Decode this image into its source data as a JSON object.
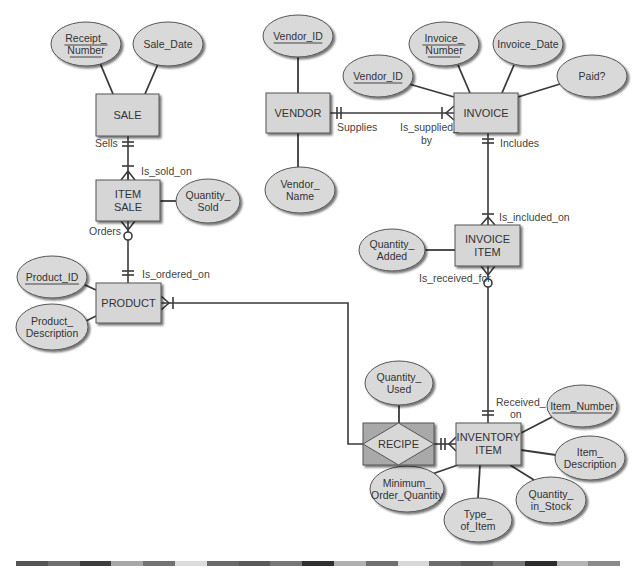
{
  "diagram": {
    "type": "entity-relationship",
    "colors": {
      "entity_fill": "#d6d6d6",
      "associative_fill": "#a9a9a9",
      "diamond_fill": "#d8d8d8",
      "attribute_fill": "#d9d9d9",
      "line": "#3a3a3a",
      "text": "#333333"
    },
    "entities": [
      {
        "id": "sale",
        "label": "SALE",
        "x": 96,
        "y": 94,
        "w": 63,
        "h": 42
      },
      {
        "id": "item_sale",
        "label_lines": [
          "ITEM",
          "SALE"
        ],
        "x": 96,
        "y": 180,
        "w": 64,
        "h": 41
      },
      {
        "id": "product",
        "label": "PRODUCT",
        "x": 96,
        "y": 283,
        "w": 65,
        "h": 40
      },
      {
        "id": "vendor",
        "label": "VENDOR",
        "x": 266,
        "y": 93,
        "w": 64,
        "h": 40
      },
      {
        "id": "invoice",
        "label": "INVOICE",
        "x": 454,
        "y": 93,
        "w": 64,
        "h": 40
      },
      {
        "id": "invoice_item",
        "label_lines": [
          "INVOICE",
          "ITEM"
        ],
        "x": 455,
        "y": 225,
        "w": 65,
        "h": 41
      },
      {
        "id": "inventory_item",
        "label_lines": [
          "INVENTORY",
          "ITEM"
        ],
        "x": 456,
        "y": 423,
        "w": 65,
        "h": 42
      }
    ],
    "associative_entity": {
      "id": "recipe",
      "label": "RECIPE",
      "x": 363,
      "y": 423,
      "w": 71,
      "h": 42
    },
    "attributes": [
      {
        "id": "receipt_number",
        "lines": [
          "Receipt_",
          "Number"
        ],
        "key": true,
        "cx": 86,
        "cy": 44,
        "rx": 35,
        "ry": 22
      },
      {
        "id": "sale_date",
        "lines": [
          "Sale_Date"
        ],
        "key": false,
        "cx": 168,
        "cy": 44,
        "rx": 35,
        "ry": 22
      },
      {
        "id": "quantity_sold",
        "lines": [
          "Quantity_",
          "Sold"
        ],
        "key": false,
        "cx": 208,
        "cy": 201,
        "rx": 32,
        "ry": 22
      },
      {
        "id": "product_id",
        "lines": [
          "Product_ID"
        ],
        "key": true,
        "cx": 52,
        "cy": 277,
        "rx": 35,
        "ry": 21
      },
      {
        "id": "product_description",
        "lines": [
          "Product_",
          "Description"
        ],
        "key": false,
        "cx": 52,
        "cy": 327,
        "rx": 36,
        "ry": 23
      },
      {
        "id": "vendor_id_v",
        "lines": [
          "Vendor_ID"
        ],
        "key": true,
        "cx": 298,
        "cy": 36,
        "rx": 35,
        "ry": 21
      },
      {
        "id": "vendor_name",
        "lines": [
          "Vendor_",
          "Name"
        ],
        "key": false,
        "cx": 300,
        "cy": 190,
        "rx": 35,
        "ry": 23
      },
      {
        "id": "vendor_id_i",
        "lines": [
          "Vendor_ID"
        ],
        "key": true,
        "cx": 378,
        "cy": 76,
        "rx": 35,
        "ry": 21
      },
      {
        "id": "invoice_number",
        "lines": [
          "Invoice_",
          "Number"
        ],
        "key": true,
        "cx": 444,
        "cy": 44,
        "rx": 35,
        "ry": 22
      },
      {
        "id": "invoice_date",
        "lines": [
          "Invoice_Date"
        ],
        "key": false,
        "cx": 528,
        "cy": 44,
        "rx": 35,
        "ry": 22
      },
      {
        "id": "paid",
        "lines": [
          "Paid?"
        ],
        "key": false,
        "cx": 592,
        "cy": 76,
        "rx": 35,
        "ry": 21
      },
      {
        "id": "quantity_added",
        "lines": [
          "Quantity_",
          "Added"
        ],
        "key": false,
        "cx": 392,
        "cy": 250,
        "rx": 33,
        "ry": 21
      },
      {
        "id": "quantity_used",
        "lines": [
          "Quantity_",
          "Used"
        ],
        "key": false,
        "cx": 399,
        "cy": 383,
        "rx": 34,
        "ry": 22
      },
      {
        "id": "item_number",
        "lines": [
          "Item_Number"
        ],
        "key": true,
        "cx": 582,
        "cy": 406,
        "rx": 35,
        "ry": 21
      },
      {
        "id": "item_description",
        "lines": [
          "Item_",
          "Description"
        ],
        "key": false,
        "cx": 590,
        "cy": 458,
        "rx": 35,
        "ry": 22
      },
      {
        "id": "minimum_order_quantity",
        "lines": [
          "Minimum_",
          "Order_Quantity"
        ],
        "key": false,
        "cx": 407,
        "cy": 489,
        "rx": 37,
        "ry": 23
      },
      {
        "id": "quantity_in_stock",
        "lines": [
          "Quantity_",
          "in_Stock"
        ],
        "key": false,
        "cx": 551,
        "cy": 500,
        "rx": 35,
        "ry": 23
      },
      {
        "id": "type_of_item",
        "lines": [
          "Type_",
          "of_Item"
        ],
        "key": false,
        "cx": 478,
        "cy": 520,
        "rx": 34,
        "ry": 22
      }
    ],
    "attribute_links": [
      [
        "receipt_number",
        113,
        94,
        100,
        63
      ],
      [
        "sale_date",
        145,
        94,
        158,
        64
      ],
      [
        "quantity_sold",
        160,
        201,
        176,
        201
      ],
      [
        "product_id",
        96,
        290,
        83,
        284
      ],
      [
        "product_description",
        96,
        316,
        80,
        324
      ],
      [
        "vendor_id_v",
        298,
        93,
        298,
        57
      ],
      [
        "vendor_name",
        298,
        133,
        298,
        167
      ],
      [
        "vendor_id_i",
        454,
        97,
        409,
        84
      ],
      [
        "invoice_number",
        470,
        93,
        458,
        65
      ],
      [
        "invoice_date",
        502,
        93,
        514,
        65
      ],
      [
        "paid",
        518,
        97,
        560,
        84
      ],
      [
        "quantity_added",
        455,
        250,
        425,
        250
      ],
      [
        "quantity_used",
        399,
        423,
        399,
        405
      ],
      [
        "item_number",
        521,
        433,
        552,
        417
      ],
      [
        "item_description",
        521,
        450,
        556,
        455
      ],
      [
        "minimum_order_quantity",
        458,
        465,
        432,
        474
      ],
      [
        "type_of_item",
        480,
        465,
        478,
        498
      ],
      [
        "quantity_in_stock",
        510,
        465,
        534,
        480
      ]
    ],
    "relationships": [
      {
        "from": "sale",
        "to": "item_sale",
        "label_from": "Sells",
        "label_to": "Is_sold_on",
        "from_card": "one-mandatory",
        "to_card": "many-mandatory"
      },
      {
        "from": "product",
        "to": "item_sale",
        "label_from": "Is_ordered_on",
        "label_to": "Orders",
        "from_card": "one-mandatory",
        "to_card": "many-optional"
      },
      {
        "from": "vendor",
        "to": "invoice",
        "label_from": "Supplies",
        "label_to": "Is_supplied_by",
        "from_card": "one-mandatory",
        "to_card": "many-mandatory"
      },
      {
        "from": "invoice",
        "to": "invoice_item",
        "label_from": "Includes",
        "label_to": "Is_included_on",
        "from_card": "one-mandatory",
        "to_card": "many-mandatory"
      },
      {
        "from": "inventory_item",
        "to": "invoice_item",
        "label_from": "Received_on",
        "label_to": "Is_received_for",
        "from_card": "one-mandatory",
        "to_card": "many-optional"
      },
      {
        "from": "product",
        "to": "recipe",
        "label_from": "",
        "label_to": "",
        "from_card": "many-mandatory",
        "to_card": "one"
      },
      {
        "from": "inventory_item",
        "to": "recipe",
        "label_from": "",
        "label_to": "",
        "from_card": "many-mandatory",
        "to_card": "one"
      }
    ],
    "relationship_labels": {
      "sells": "Sells",
      "is_sold_on": "Is_sold_on",
      "orders": "Orders",
      "is_ordered_on": "Is_ordered_on",
      "supplies": "Supplies",
      "is_supplied_line1": "Is_supplied_",
      "is_supplied_line2": "by",
      "includes": "Includes",
      "is_included_on": "Is_included_on",
      "is_received_for": "Is_received_for",
      "received_line1": "Received_",
      "received_line2": "on"
    },
    "stripe_colors": [
      "#555555",
      "#6e6e6e",
      "#3d3d3d",
      "#a8a8a8",
      "#727272",
      "#dcdcdc",
      "#6a6a6a",
      "#5a5a5a",
      "#777777",
      "#2f2f2f",
      "#b0b0b0",
      "#6f6f6f",
      "#d8d8d8",
      "#6c6c6c",
      "#5b5b5b",
      "#767676",
      "#2c2c2c",
      "#b4b4b4",
      "#8a8a8a"
    ]
  }
}
